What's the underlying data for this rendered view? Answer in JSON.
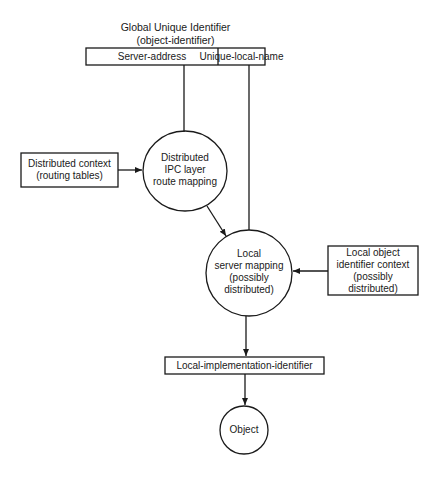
{
  "diagram": {
    "title_line1": "Global Unique Identifier",
    "title_line2": "(object-identifier)",
    "identifier_fields": [
      "Server-address",
      "Unique-local-name"
    ],
    "nodes": {
      "routing_context": {
        "line1": "Distributed context",
        "line2": "(routing tables)"
      },
      "ipc_mapping": {
        "line1": "Distributed",
        "line2": "IPC layer",
        "line3": "route mapping"
      },
      "local_server_mapping": {
        "line1": "Local",
        "line2": "server mapping",
        "line3": "(possibly",
        "line4": "distributed)"
      },
      "local_object_context": {
        "line1": "Local object",
        "line2": "identifier context",
        "line3": "(possibly",
        "line4": "distributed)"
      },
      "local_impl_id": {
        "label": "Local-implementation-identifier"
      },
      "object": {
        "label": "Object"
      }
    },
    "edges": [
      {
        "from": "Server-address",
        "to": "Distributed IPC layer route mapping"
      },
      {
        "from": "Distributed context (routing tables)",
        "to": "Distributed IPC layer route mapping"
      },
      {
        "from": "Distributed IPC layer route mapping",
        "to": "Local server mapping"
      },
      {
        "from": "Unique-local-name",
        "to": "Local server mapping"
      },
      {
        "from": "Local object identifier context",
        "to": "Local server mapping"
      },
      {
        "from": "Local server mapping",
        "to": "Local-implementation-identifier"
      },
      {
        "from": "Local-implementation-identifier",
        "to": "Object"
      }
    ],
    "colors": {
      "stroke": "#1a1a1a",
      "background": "#ffffff"
    }
  }
}
